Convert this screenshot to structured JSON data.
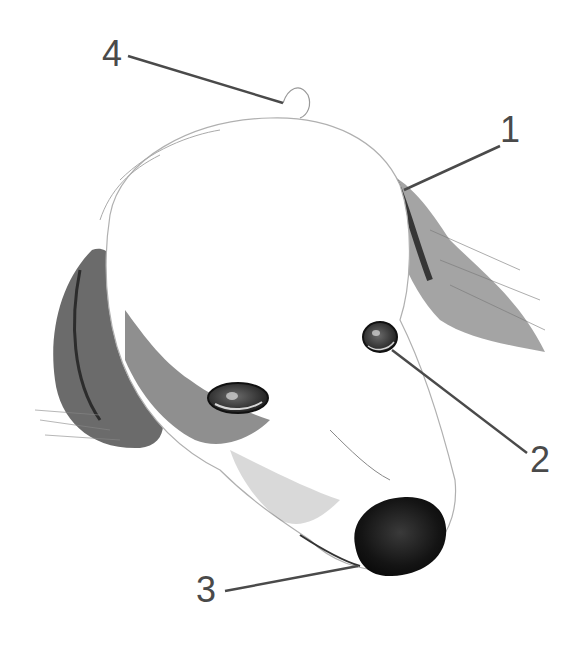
{
  "figure": {
    "colors": {
      "background": "#ffffff",
      "leader_line": "#4a4a4a",
      "label": "#4a4a4a",
      "ink_dark": "#1a1a1a",
      "ink_mid": "#555555",
      "ink_light": "#9a9a9a"
    },
    "callouts": [
      {
        "id": "1",
        "text": "1",
        "target": "ear-base",
        "label_pos": [
          508,
          112
        ],
        "line": [
          [
            500,
            146
          ],
          [
            404,
            190
          ]
        ]
      },
      {
        "id": "2",
        "text": "2",
        "target": "eye",
        "label_pos": [
          530,
          442
        ],
        "line": [
          [
            527,
            453
          ],
          [
            392,
            350
          ]
        ]
      },
      {
        "id": "3",
        "text": "3",
        "target": "mouth-corner",
        "label_pos": [
          196,
          562
        ],
        "line": [
          [
            225,
            591
          ],
          [
            358,
            566
          ]
        ]
      },
      {
        "id": "4",
        "text": "4",
        "target": "head-top-tuft",
        "label_pos": [
          102,
          36
        ],
        "line": [
          [
            128,
            56
          ],
          [
            283,
            103
          ]
        ]
      }
    ]
  }
}
